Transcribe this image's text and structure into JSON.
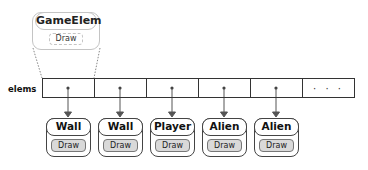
{
  "prototype": {
    "title": "GameElem",
    "method": "Draw"
  },
  "array": {
    "label": "elems",
    "ellipsis": "· · ·"
  },
  "objects": [
    {
      "title": "Wall",
      "method": "Draw"
    },
    {
      "title": "Wall",
      "method": "Draw"
    },
    {
      "title": "Player",
      "method": "Draw"
    },
    {
      "title": "Alien",
      "method": "Draw"
    },
    {
      "title": "Alien",
      "method": "Draw"
    }
  ]
}
